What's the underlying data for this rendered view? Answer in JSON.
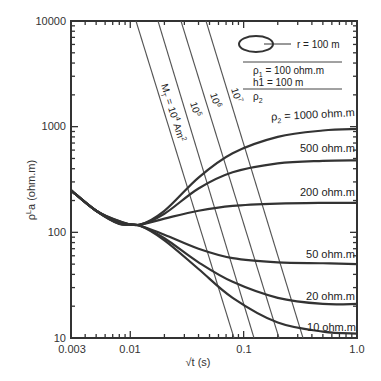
{
  "chart_data": {
    "type": "line",
    "title": "",
    "xlabel": "√t (s)",
    "ylabel": "ρ^L a (ohm.m)",
    "xscale": "log",
    "yscale": "log",
    "xlim": [
      0.003,
      1.0
    ],
    "ylim": [
      10,
      10000
    ],
    "grid": false,
    "x_ticks": [
      "0.003",
      "0.01",
      "0.1",
      "1.0"
    ],
    "y_ticks": [
      "10",
      "100",
      "1000",
      "10000"
    ],
    "legend_box": {
      "loop_label": "r = 100 m",
      "rho1_label": "ρ1 = 100 ohm.m",
      "h1_label": "h1 = 100 m",
      "rho2_label": "ρ2"
    },
    "series": [
      {
        "name": "ρ2 = 1000 ohm.m",
        "label": "ρ2 = 1000 ohm.m",
        "x": [
          0.003,
          0.005,
          0.008,
          0.012,
          0.02,
          0.04,
          0.08,
          0.2,
          0.5,
          1.0
        ],
        "y": [
          250,
          160,
          128,
          118,
          160,
          330,
          560,
          800,
          920,
          950
        ]
      },
      {
        "name": "ρ2 = 500 ohm.m",
        "label": "500 ohm.m",
        "x": [
          0.003,
          0.005,
          0.008,
          0.012,
          0.02,
          0.04,
          0.08,
          0.2,
          0.5,
          1.0
        ],
        "y": [
          250,
          160,
          127,
          118,
          150,
          260,
          370,
          450,
          475,
          480
        ]
      },
      {
        "name": "ρ2 = 200 ohm.m",
        "label": "200 ohm.m",
        "x": [
          0.003,
          0.005,
          0.008,
          0.012,
          0.02,
          0.04,
          0.08,
          0.2,
          0.5,
          1.0
        ],
        "y": [
          250,
          160,
          125,
          118,
          135,
          160,
          178,
          187,
          190,
          190
        ]
      },
      {
        "name": "ρ2 = 50 ohm.m",
        "label": "50 ohm.m",
        "x": [
          0.003,
          0.005,
          0.008,
          0.012,
          0.02,
          0.04,
          0.08,
          0.2,
          0.5,
          1.0
        ],
        "y": [
          250,
          160,
          122,
          116,
          95,
          70,
          57,
          52,
          51,
          50
        ]
      },
      {
        "name": "ρ2 = 20 ohm.m",
        "label": "20 ohm.m",
        "x": [
          0.003,
          0.005,
          0.008,
          0.012,
          0.02,
          0.04,
          0.08,
          0.2,
          0.5,
          1.0
        ],
        "y": [
          250,
          160,
          121,
          116,
          88,
          52,
          34,
          24,
          21,
          21
        ]
      },
      {
        "name": "ρ2 = 10 ohm.m",
        "label": "10 ohm.m",
        "x": [
          0.003,
          0.005,
          0.008,
          0.012,
          0.02,
          0.04,
          0.08,
          0.2,
          0.5,
          1.0
        ],
        "y": [
          250,
          160,
          120,
          116,
          84,
          45,
          24,
          14,
          11.5,
          11
        ]
      }
    ],
    "moment_lines": [
      {
        "label": "MT = 10^4 Am^2",
        "x_top": 0.0076,
        "x_bottom": 0.0555
      },
      {
        "label": "10^5",
        "x_top": 0.0119,
        "x_bottom": 0.083
      },
      {
        "label": "10^6",
        "x_top": 0.0187,
        "x_bottom": 0.138
      },
      {
        "label": "10^7",
        "x_top": 0.031,
        "x_bottom": 0.226
      }
    ]
  },
  "labels": {
    "xlabel": "√t (s)",
    "ylabel_main": "ρ",
    "ylabel_sup": "L",
    "ylabel_rest": "a (ohm.m)",
    "xt0": "0.003",
    "xt1": "0.01",
    "xt2": "0.1",
    "xt3": "1.0",
    "yt0": "10",
    "yt1": "100",
    "yt2": "1000",
    "yt3": "10000",
    "loop": "r = 100 m",
    "rho1": "ρ",
    "rho1_sub": "1",
    "rho1_rest": " = 100 ohm.m",
    "h1": "h1 = 100 m",
    "rho2": "ρ",
    "rho2_sub": "2",
    "c1000_a": "ρ",
    "c1000_sub": "2",
    "c1000_b": " = 1000 ohm.m",
    "c500": "500 ohm.m",
    "c200": "200 ohm.m",
    "c50": "50 ohm.m",
    "c20": "20 ohm.m",
    "c10": "10 ohm.m",
    "m4_a": "M",
    "m4_sub": "T",
    "m4_b": " = 10",
    "m4_sup": "4",
    "m4_c": " Am",
    "m4_sup2": "2",
    "m5": "10",
    "m5_sup": "5",
    "m6": "10",
    "m6_sup": "6",
    "m7": "10",
    "m7_sup": "7"
  }
}
